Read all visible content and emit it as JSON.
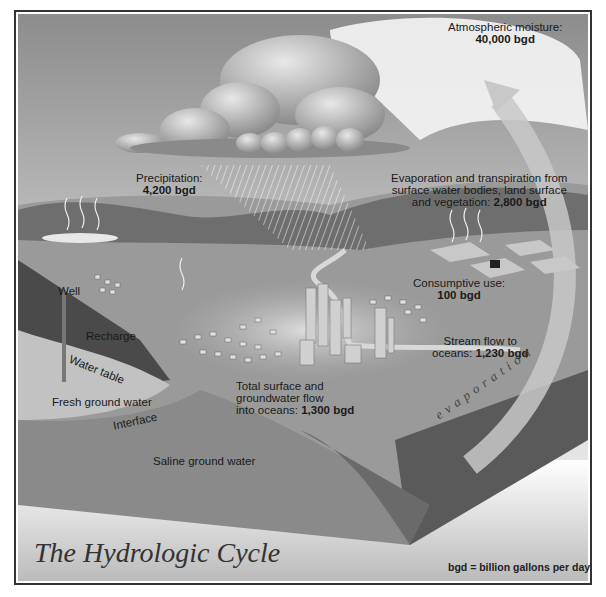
{
  "title": "The Hydrologic Cycle",
  "legend": "bgd = billion gallons per day",
  "labels": {
    "atmospheric": {
      "line1": "Atmospheric moisture:",
      "value": "40,000 bgd"
    },
    "precipitation": {
      "line1": "Precipitation:",
      "value": "4,200 bgd"
    },
    "evapotranspiration": {
      "line1": "Evaporation and transpiration from",
      "line2": "surface water bodies, land surface",
      "line3": "and vegetation:",
      "value": "2,800 bgd"
    },
    "consumptive": {
      "line1": "Consumptive use:",
      "value": "100 bgd"
    },
    "streamflow": {
      "line1": "Stream flow to",
      "line2": "oceans:",
      "value": "1,230 bgd"
    },
    "total_flow": {
      "line1": "Total surface and",
      "line2": "groundwater flow",
      "line3": "into oceans:",
      "value": "1,300 bgd"
    },
    "well": "Well",
    "recharge": "Recharge",
    "water_table": "Water table",
    "fresh_ground_water": "Fresh ground water",
    "interface": "Interface",
    "saline_ground_water": "Saline ground water",
    "evaporation_arc": "evaporation"
  }
}
